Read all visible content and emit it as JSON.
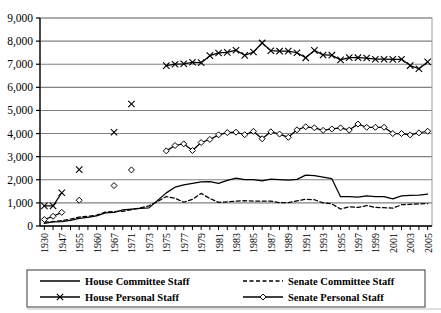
{
  "chart_data": {
    "type": "line",
    "title": "",
    "xlabel": "",
    "ylabel": "",
    "ylim": [
      0,
      9000
    ],
    "ytick_step": 1000,
    "grid": "horizontal",
    "legend_position": "below-plot",
    "ytick_labels": [
      "0",
      "1,000",
      "2,000",
      "3,000",
      "4,000",
      "5,000",
      "6,000",
      "7,000",
      "8,000",
      "9,000"
    ],
    "categories": [
      "1930",
      "1935",
      "1947",
      "1950",
      "1955",
      "1957",
      "1960",
      "1965",
      "1967",
      "1970",
      "1971",
      "1972",
      "1973",
      "1974",
      "1975",
      "1976",
      "1977",
      "1978",
      "1979",
      "1980",
      "1981",
      "1982",
      "1983",
      "1984",
      "1985",
      "1986",
      "1987",
      "1988",
      "1989",
      "1990",
      "1991",
      "1992",
      "1993",
      "1994",
      "1995",
      "1996",
      "1997",
      "1998",
      "1999",
      "2000",
      "2001",
      "2002",
      "2003",
      "2004",
      "2005"
    ],
    "xtick_labels": [
      "1930",
      "",
      "1947",
      "",
      "1955",
      "",
      "1960",
      "",
      "1967",
      "",
      "1971",
      "",
      "1973",
      "",
      "1975",
      "",
      "1977",
      "",
      "1979",
      "",
      "1981",
      "",
      "1983",
      "",
      "1985",
      "",
      "1987",
      "",
      "1989",
      "",
      "1991",
      "",
      "1993",
      "",
      "1995",
      "",
      "1997",
      "",
      "1999",
      "",
      "2001",
      "",
      "2003",
      "",
      "2005"
    ],
    "series": [
      {
        "name": "House Committee Staff",
        "style": "solid-line",
        "marker": "none",
        "color": "#000000",
        "values": [
          112,
          180,
          193,
          246,
          329,
          375,
          440,
          571,
          589,
          700,
          729,
          761,
          783,
          1107,
          1433,
          1680,
          1776,
          1844,
          1909,
          1917,
          1843,
          1973,
          2068,
          2007,
          2009,
          1954,
          2024,
          2002,
          1986,
          2020,
          2201,
          2178,
          2118,
          2046,
          1266,
          1276,
          1250,
          1305,
          1267,
          1272,
          1177,
          1300,
          1321,
          1340,
          1380
        ]
      },
      {
        "name": "Senate Committee Staff",
        "style": "dashed-line",
        "marker": "none",
        "color": "#000000",
        "values": [
          163,
          190,
          232,
          300,
          386,
          420,
          470,
          600,
          621,
          635,
          711,
          780,
          873,
          1060,
          1277,
          1201,
          1028,
          1151,
          1410,
          1191,
          1022,
          1047,
          1075,
          1095,
          1080,
          1075,
          1074,
          1013,
          1013,
          1090,
          1154,
          1137,
          1000,
          958,
          732,
          832,
          805,
          882,
          805,
          792,
          770,
          920,
          940,
          955,
          970
        ]
      },
      {
        "name": "House Personal Staff",
        "style": "solid-line-with-marker",
        "marker": "x",
        "color": "#000000",
        "values": [
          870,
          870,
          1440,
          null,
          2441,
          null,
          null,
          null,
          4055,
          null,
          5280,
          null,
          null,
          null,
          6939,
          7000,
          7020,
          7084,
          7067,
          7371,
          7487,
          7511,
          7606,
          7385,
          7528,
          7920,
          7584,
          7564,
          7569,
          7496,
          7278,
          7597,
          7400,
          7390,
          7186,
          7288,
          7282,
          7269,
          7216,
          7216,
          7209,
          7214,
          6942,
          6805,
          7100
        ]
      },
      {
        "name": "Senate Personal Staff",
        "style": "solid-line-with-marker",
        "marker": "diamond",
        "color": "#000000",
        "values": [
          280,
          420,
          590,
          null,
          1115,
          null,
          null,
          null,
          1749,
          null,
          2426,
          null,
          null,
          null,
          3251,
          3483,
          3554,
          3268,
          3612,
          3746,
          3945,
          4041,
          4059,
          3949,
          4097,
          3774,
          4075,
          3977,
          3837,
          4162,
          4294,
          4249,
          4138,
          4200,
          4247,
          4151,
          4410,
          4272,
          4272,
          4272,
          4000,
          4000,
          3940,
          4030,
          4100
        ]
      }
    ]
  },
  "legend": {
    "items": [
      {
        "label": "House Committee Staff",
        "style": "solid",
        "marker": "none"
      },
      {
        "label": "Senate Committee Staff",
        "style": "dashed",
        "marker": "none"
      },
      {
        "label": "House Personal Staff",
        "style": "solid",
        "marker": "x"
      },
      {
        "label": "Senate Personal Staff",
        "style": "solid",
        "marker": "diamond"
      }
    ]
  },
  "colors": {
    "axis": "#000000",
    "gridline": "#808080",
    "plot_background": "#ffffff",
    "series": "#000000"
  }
}
